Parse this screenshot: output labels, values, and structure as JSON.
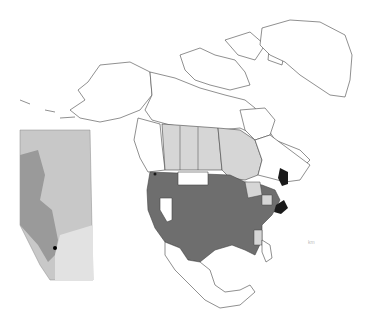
{
  "map": {
    "title": "North America distribution map with Alberta inset",
    "colors": {
      "present": "#6e6e6e",
      "uncertain": "#d6d6d6",
      "absent": "#ffffff",
      "highlight": "#1a1a1a",
      "outline": "#444444",
      "inset_base": "#c8c8c8",
      "inset_dark": "#9a9a9a",
      "inset_light": "#e2e2e2"
    },
    "legend_categories": [
      "present",
      "uncertain",
      "absent",
      "highlight"
    ],
    "regions": {
      "present": [
        "Western & Central United States",
        "Southeastern United States",
        "Northeastern United States"
      ],
      "uncertain": [
        "Alberta",
        "Saskatchewan",
        "Manitoba",
        "Ontario",
        "Michigan",
        "Ohio",
        "Mississippi"
      ],
      "absent": [
        "Montana",
        "Nevada",
        "Alaska",
        "Northern Canada",
        "Greenland",
        "Mexico"
      ],
      "highlight": [
        "Maine",
        "West Virginia",
        "British Columbia coast point",
        "San Francisco point"
      ]
    },
    "inset": {
      "region": "Alberta",
      "marker": "Locality point"
    },
    "scale_label": "km"
  }
}
